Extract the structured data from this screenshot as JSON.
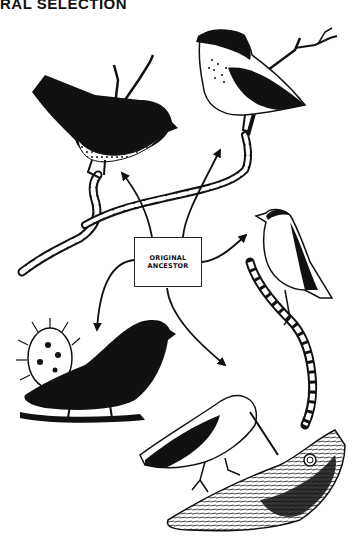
{
  "header": {
    "title": "RAL SELECTION"
  },
  "diagram": {
    "center_label_line1": "ORIGINAL",
    "center_label_line2": "ANCESTOR",
    "nodes": [
      {
        "id": "ancestor",
        "label": "ORIGINAL ANCESTOR",
        "position": "center"
      },
      {
        "id": "finch-top-left",
        "description": "dark seed-eating finch with speckled belly on branch",
        "position": "top-left"
      },
      {
        "id": "finch-top-right",
        "description": "pale spotted-breast finch on twig",
        "position": "top-right"
      },
      {
        "id": "warbler-right",
        "description": "slender warbler finch on upright branch",
        "position": "right"
      },
      {
        "id": "ground-finch-left",
        "description": "large black ground finch beside cactus",
        "position": "bottom-left"
      },
      {
        "id": "woodpecker-finch-bottom",
        "description": "long-billed finch probing bark",
        "position": "bottom-right"
      }
    ],
    "edges": [
      {
        "from": "ancestor",
        "to": "finch-top-left"
      },
      {
        "from": "ancestor",
        "to": "finch-top-right"
      },
      {
        "from": "ancestor",
        "to": "warbler-right"
      },
      {
        "from": "ancestor",
        "to": "ground-finch-left"
      },
      {
        "from": "ancestor",
        "to": "woodpecker-finch-bottom"
      }
    ]
  },
  "colors": {
    "ink": "#111111",
    "paper": "#ffffff"
  }
}
